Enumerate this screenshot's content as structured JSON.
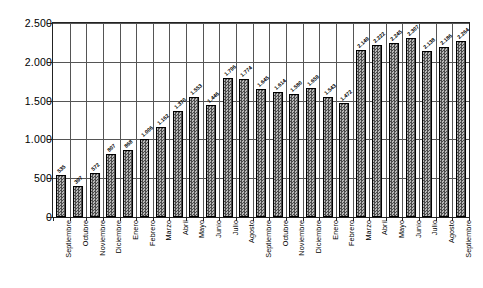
{
  "chart_data": {
    "type": "bar",
    "title": "",
    "subtitle": "",
    "xlabel": "",
    "ylabel": "",
    "ylim": [
      0,
      2500
    ],
    "grid": true,
    "legend": "none",
    "y_ticks": [
      0,
      500,
      1000,
      1500,
      2000,
      2500
    ],
    "y_tick_labels": [
      "0",
      "500",
      "1.000",
      "1.500",
      "2.000",
      "2.500"
    ],
    "categories": [
      "Septiembre",
      "Octubre",
      "Noviembre",
      "Diciembre",
      "Enero",
      "Febrero",
      "Marzo",
      "Abril",
      "Mayo",
      "Junio",
      "Julio",
      "Agosto",
      "Septiembre",
      "Octubre",
      "Noviembre",
      "Diciembre",
      "Enero",
      "Febrero",
      "Marzo",
      "Abril",
      "Mayo",
      "Junio",
      "Julio",
      "Agosto",
      "Septiembre"
    ],
    "values": [
      535,
      397,
      572,
      807,
      868,
      1006,
      1162,
      1370,
      1553,
      1446,
      1796,
      1774,
      1645,
      1614,
      1580,
      1659,
      1543,
      1472,
      2149,
      2222,
      2245,
      2307,
      2138,
      2186,
      2264
    ],
    "value_labels": [
      "535",
      "397",
      "572",
      "807",
      "868",
      "1.006",
      "1.162",
      "1.370",
      "1.553",
      "1.446",
      "1.796",
      "1.774",
      "1.645",
      "1.614",
      "1.580",
      "1.659",
      "1.543",
      "1.472",
      "2.149",
      "2.222",
      "2.245",
      "2.307",
      "2.138",
      "2.186",
      "2.264"
    ],
    "colors": {
      "bar_fill": "#6e6e6e",
      "bar_edge": "#000000",
      "grid": "#555555",
      "frame": "#222222",
      "text": "#000000",
      "background": "#ffffff"
    }
  }
}
